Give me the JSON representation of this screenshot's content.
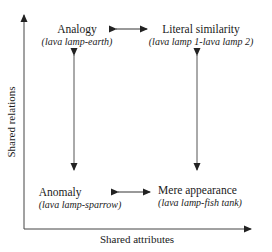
{
  "diagram": {
    "axes": {
      "x_label": "Shared attributes",
      "y_label": "Shared relations"
    },
    "quadrants": {
      "top_left": {
        "title": "Analogy",
        "example": "(lava lamp-earth)"
      },
      "top_right": {
        "title": "Literal similarity",
        "example": "(lava lamp 1-lava lamp 2)"
      },
      "bottom_left": {
        "title": "Anomaly",
        "example": "(lava lamp-sparrow)"
      },
      "bottom_right": {
        "title": "Mere appearance",
        "example": "(lava lamp-fish tank)"
      }
    },
    "colors": {
      "line": "#333333",
      "text": "#1a1a1a",
      "background": "#ffffff"
    }
  }
}
